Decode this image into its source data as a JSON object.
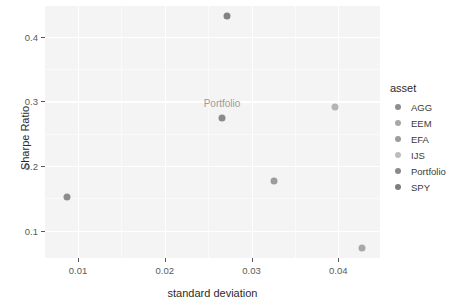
{
  "chart_data": {
    "type": "scatter",
    "title": "",
    "xlabel": "standard deviation",
    "ylabel": "Sharpe Ratio",
    "xlim": [
      0.0062,
      0.0448
    ],
    "ylim": [
      0.058,
      0.4475
    ],
    "xticks": [
      0.01,
      0.02,
      0.03,
      0.04
    ],
    "xtick_labels": [
      "0.01",
      "0.02",
      "0.03",
      "0.04"
    ],
    "yticks": [
      0.1,
      0.2,
      0.3,
      0.4
    ],
    "ytick_labels": [
      "0.1",
      "0.2",
      "0.3",
      "0.4"
    ],
    "grid": true,
    "legend_position": "right",
    "legend_title": "asset",
    "point_annotations": [
      {
        "text": "Portfolio",
        "x": 0.0266,
        "y": 0.2975
      }
    ],
    "series": [
      {
        "name": "AGG",
        "x": 0.0087,
        "y": 0.152,
        "color": "#8d8d8d"
      },
      {
        "name": "EEM",
        "x": 0.0427,
        "y": 0.074,
        "color": "#a8a8a8"
      },
      {
        "name": "EFA",
        "x": 0.0326,
        "y": 0.177,
        "color": "#9c9c9c"
      },
      {
        "name": "IJS",
        "x": 0.0396,
        "y": 0.292,
        "color": "#b4b4b4"
      },
      {
        "name": "Portfolio",
        "x": 0.0266,
        "y": 0.274,
        "color": "#8a8a8a"
      },
      {
        "name": "SPY",
        "x": 0.0272,
        "y": 0.432,
        "color": "#828282"
      }
    ]
  },
  "legend": {
    "title": "asset",
    "items": [
      {
        "label": "AGG",
        "color": "#8d8d8d"
      },
      {
        "label": "EEM",
        "color": "#a8a8a8"
      },
      {
        "label": "EFA",
        "color": "#9c9c9c"
      },
      {
        "label": "IJS",
        "color": "#bdbdbd"
      },
      {
        "label": "Portfolio",
        "color": "#8a8a8a"
      },
      {
        "label": "SPY",
        "color": "#7e7e7e"
      }
    ]
  },
  "axes": {
    "x_title": "standard deviation",
    "y_title": "Sharpe Ratio"
  }
}
